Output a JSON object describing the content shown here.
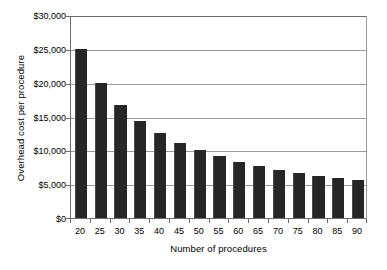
{
  "chart_data": {
    "type": "bar",
    "title": "",
    "subtitle": "",
    "xlabel": "Number of procedures",
    "ylabel": "Overhead cost per procedure",
    "categories": [
      "20",
      "25",
      "30",
      "35",
      "40",
      "45",
      "50",
      "55",
      "60",
      "65",
      "70",
      "75",
      "80",
      "85",
      "90"
    ],
    "values": [
      25000,
      20000,
      16667,
      14286,
      12500,
      11111,
      10000,
      9091,
      8333,
      7692,
      7143,
      6667,
      6250,
      5882,
      5556
    ],
    "value_labels": [
      "$25,000",
      "$20,000",
      "$16,667",
      "$14,286",
      "$12,500",
      "$11,111",
      "$10,000",
      "$9,091",
      "$8,333",
      "$7,692",
      "$7,143",
      "$6,667",
      "$6,250",
      "$5,882",
      "$5,556"
    ],
    "ylim": [
      0,
      30000
    ],
    "xlim_categories": 15,
    "ytick_values": [
      30000,
      25000,
      20000,
      15000,
      10000,
      5000,
      0
    ],
    "ytick_labels": [
      "$30,000",
      "$25,000",
      "$20,000",
      "$15,000",
      "$10,000",
      "$5,000",
      "$0"
    ],
    "grid": true,
    "grid_axis": "y",
    "legend": false,
    "legend_position": "none",
    "bar_color": "#262626",
    "gridline_color": "#9a9a9a",
    "axis_color": "#6b6b6b",
    "background_color": "#ffffff",
    "annotations": []
  }
}
